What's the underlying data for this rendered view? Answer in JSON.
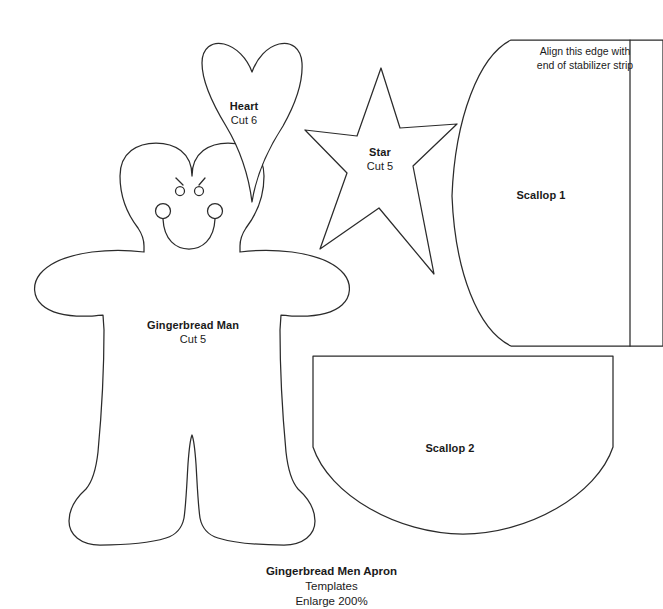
{
  "document": {
    "caption_title": "Gingerbread Men Apron",
    "caption_line2": "Templates",
    "caption_line3": "Enlarge 200%"
  },
  "templates": [
    {
      "id": "heart",
      "title": "Heart",
      "cut": "Cut 6"
    },
    {
      "id": "star",
      "title": "Star",
      "cut": "Cut 5"
    },
    {
      "id": "gingerbread-man",
      "title": "Gingerbread Man",
      "cut": "Cut 5"
    },
    {
      "id": "scallop-1",
      "title": "Scallop 1",
      "cut": ""
    },
    {
      "id": "scallop-2",
      "title": "Scallop 2",
      "cut": ""
    }
  ],
  "notes": {
    "align_line1": "Align this edge with",
    "align_line2": "end of stabilizer strip"
  },
  "style": {
    "line_color": "#2b2b2b",
    "fill_color": "#ffffff",
    "background": "#ffffff",
    "text_color": "#1a1a1a"
  }
}
